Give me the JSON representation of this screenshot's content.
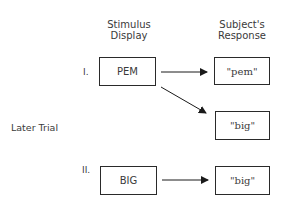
{
  "headers": {
    "stimulus": [
      "Stimulus",
      "Display"
    ],
    "response": [
      "Subject's",
      "Response"
    ]
  },
  "side_label": "Later Trial",
  "trials": [
    {
      "numeral": "I.",
      "stimulus": "PEM",
      "responses": [
        "\"pem\"",
        "\"big\""
      ]
    },
    {
      "numeral": "II.",
      "stimulus": "BIG",
      "responses": [
        "\"big\""
      ]
    }
  ],
  "colors": {
    "line": "#2a2a2a",
    "text": "#3a3a3a"
  }
}
